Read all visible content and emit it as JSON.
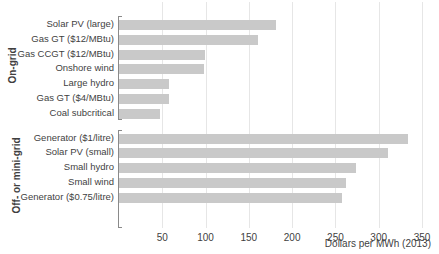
{
  "chart_data": {
    "type": "bar",
    "orientation": "horizontal",
    "title": "",
    "xlabel": "Dollars per MWh (2013)",
    "ylabel": "",
    "xlim": [
      0,
      350
    ],
    "xticks": [
      50,
      100,
      150,
      200,
      250,
      300,
      350
    ],
    "grid": true,
    "legend": null,
    "bar_color": "#c9c9c9",
    "groups": [
      {
        "name": "On-grid",
        "categories": [
          "Solar PV (large)",
          "Gas GT ($12/MBtu)",
          "Gas CCGT ($12/MBtu)",
          "Onshore wind",
          "Large hydro",
          "Gas GT ($4/MBtu)",
          "Coal subcritical"
        ],
        "values": [
          181,
          160,
          99,
          98,
          58,
          58,
          47
        ]
      },
      {
        "name": "Off- or mini-grid",
        "categories": [
          "Generator ($1/litre)",
          "Solar PV (small)",
          "Small hydro",
          "Small wind",
          "Generator ($0.75/litre)"
        ],
        "values": [
          334,
          311,
          274,
          262,
          258
        ]
      }
    ]
  }
}
